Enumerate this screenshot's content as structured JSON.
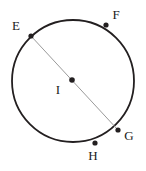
{
  "figure": {
    "type": "circle-diagram",
    "width": 146,
    "height": 171,
    "background_color": "#ffffff",
    "circle": {
      "name": "circle-outline",
      "center_x": 73,
      "center_y": 81,
      "radius": 61,
      "stroke_color": "#231f20",
      "stroke_width": 1.8,
      "fill": "none"
    },
    "chord": {
      "name": "diameter-EG",
      "from": "E",
      "to": "G",
      "x1": 31,
      "y1": 36,
      "x2": 118,
      "y2": 130,
      "stroke_color": "#9a9a9a",
      "stroke_width": 1
    },
    "points": [
      {
        "id": "E",
        "label": "E",
        "x": 31,
        "y": 36,
        "label_x": 16,
        "label_y": 27,
        "dot_radius": 2.6,
        "color": "#231f20",
        "on_circle": true
      },
      {
        "id": "F",
        "label": "F",
        "x": 106,
        "y": 25,
        "label_x": 116,
        "label_y": 16,
        "dot_radius": 2.6,
        "color": "#231f20",
        "on_circle": true
      },
      {
        "id": "G",
        "label": "G",
        "x": 118,
        "y": 130,
        "label_x": 129,
        "label_y": 137,
        "dot_radius": 2.6,
        "color": "#231f20",
        "on_circle": true
      },
      {
        "id": "H",
        "label": "H",
        "x": 95,
        "y": 143,
        "label_x": 93,
        "label_y": 157,
        "dot_radius": 2.6,
        "color": "#231f20",
        "on_circle": true
      },
      {
        "id": "I",
        "label": "I",
        "x": 72,
        "y": 80,
        "label_x": 58,
        "label_y": 91,
        "dot_radius": 2.8,
        "color": "#231f20",
        "on_circle": false
      }
    ]
  }
}
